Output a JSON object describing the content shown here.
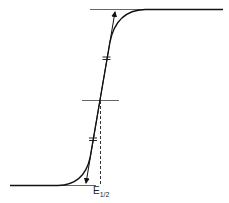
{
  "diagram": {
    "type": "sigmoid-wave-with-tangent-construction",
    "label_main": "E",
    "label_sub": "1/2",
    "colors": {
      "curve": "#111111",
      "baselines": "#666666",
      "tangent": "#111111",
      "dashed": "#333333"
    },
    "elements": [
      "lower plateau line",
      "upper plateau line",
      "mid-height horizontal line",
      "sigmoidal curve",
      "tangent line with arrowheads at both ends",
      "equal-length tick marks on tangent",
      "dashed vertical from midpoint to baseline"
    ]
  }
}
